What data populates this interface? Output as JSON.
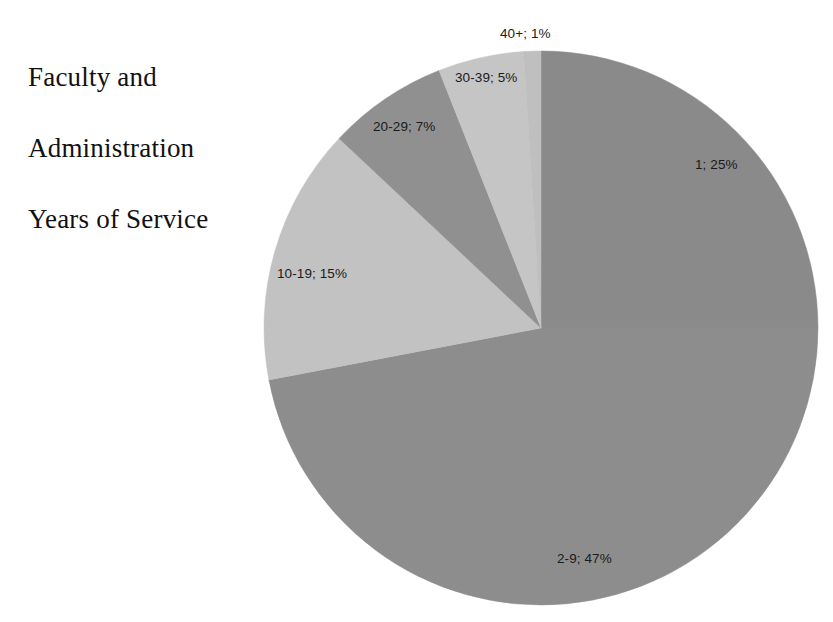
{
  "title": {
    "lines": [
      "Faculty and",
      "Administration",
      "Years of Service"
    ],
    "full": "Faculty and Administration Years of Service"
  },
  "labels": {
    "s1": "1; 25%",
    "s29": "2-9; 47%",
    "s1019": "10-19; 15%",
    "s2029": "20-29; 7%",
    "s3039": "30-39; 5%",
    "s40plus": "40+; 1%"
  },
  "chart_data": {
    "type": "pie",
    "title": "Faculty and Administration Years of Service",
    "subtitle": "",
    "xlabel": "",
    "ylabel": "",
    "legend": "none",
    "grid": false,
    "label_format": "category; percent",
    "start_angle_deg": 0,
    "direction": "clockwise",
    "categories": [
      "1",
      "2-9",
      "10-19",
      "20-29",
      "30-39",
      "40+"
    ],
    "values": [
      25,
      47,
      15,
      7,
      5,
      1
    ],
    "units": "percent",
    "colors": [
      "#8a8a8a",
      "#8d8d8d",
      "#c2c2c2",
      "#909090",
      "#c5c5c5",
      "#bfbfbf"
    ],
    "data_labels": [
      "1; 25%",
      "2-9; 47%",
      "10-19; 15%",
      "20-29; 7%",
      "30-39; 5%",
      "40+; 1%"
    ],
    "slices": [
      {
        "category": "1",
        "value": 25,
        "label": "1; 25%",
        "color": "#8a8a8a",
        "start_deg": 0,
        "end_deg": 90.0
      },
      {
        "category": "2-9",
        "value": 47,
        "label": "2-9; 47%",
        "color": "#8d8d8d",
        "start_deg": 90.0,
        "end_deg": 259.2
      },
      {
        "category": "10-19",
        "value": 15,
        "label": "10-19; 15%",
        "color": "#c2c2c2",
        "start_deg": 259.2,
        "end_deg": 313.2
      },
      {
        "category": "20-29",
        "value": 7,
        "label": "20-29; 7%",
        "color": "#909090",
        "start_deg": 313.2,
        "end_deg": 338.4
      },
      {
        "category": "30-39",
        "value": 5,
        "label": "30-39; 5%",
        "color": "#c5c5c5",
        "start_deg": 338.4,
        "end_deg": 356.4
      },
      {
        "category": "40+",
        "value": 1,
        "label": "40+; 1%",
        "color": "#bfbfbf",
        "start_deg": 356.4,
        "end_deg": 360.0
      }
    ],
    "geometry": {
      "center_x": 541,
      "center_y": 328,
      "radius": 277
    },
    "background_color": "#ffffff",
    "text_color": "#1a1a1a"
  }
}
